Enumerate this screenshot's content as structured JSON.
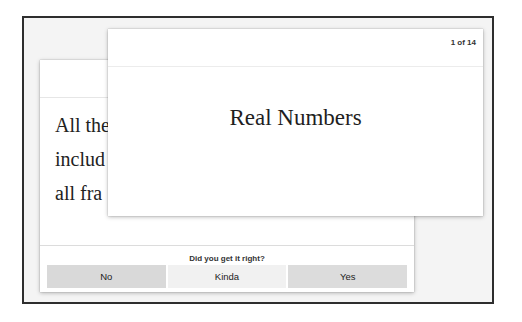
{
  "back_card": {
    "text_lines": [
      "All the",
      "includ",
      "all fra"
    ],
    "prompt": "Did you get it right?",
    "buttons": [
      {
        "label": "No"
      },
      {
        "label": "Kinda"
      },
      {
        "label": "Yes"
      }
    ]
  },
  "front_card": {
    "counter": "1 of 14",
    "title": "Real Numbers"
  }
}
